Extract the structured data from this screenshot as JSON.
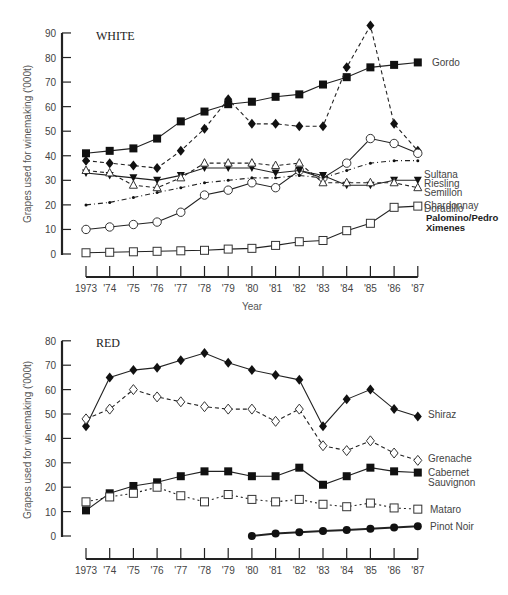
{
  "chart_data": [
    {
      "type": "line",
      "title": "WHITE",
      "xlabel": "Year",
      "ylabel": "Grapes used for winemaking ('000t)",
      "ylim": [
        0,
        90
      ],
      "yticks": [
        0,
        10,
        20,
        30,
        40,
        50,
        60,
        70,
        80,
        90
      ],
      "grid": false,
      "legend_position": "inline-right",
      "categories": [
        "1973",
        "'74",
        "'75",
        "'76",
        "'77",
        "'78",
        "'79",
        "'80",
        "'81",
        "'82",
        "'83",
        "'84",
        "'85",
        "'86",
        "'87"
      ],
      "series": [
        {
          "name": "Gordo",
          "marker": "filled-square",
          "line": "solid",
          "values": [
            41,
            42,
            43,
            47,
            54,
            58,
            61,
            62,
            64,
            65,
            69,
            72,
            76,
            77,
            78
          ]
        },
        {
          "name": "Sultana",
          "marker": "filled-diamond",
          "line": "dashed",
          "values": [
            38,
            37,
            36,
            35,
            42,
            51,
            63,
            53,
            53,
            52,
            52,
            76,
            93,
            53,
            42
          ]
        },
        {
          "name": "Riesling",
          "marker": "open-circle",
          "line": "solid",
          "values": [
            10,
            11,
            12,
            13,
            17,
            24,
            26,
            29,
            27,
            34,
            31,
            37,
            47,
            45,
            41
          ]
        },
        {
          "name": "Semillon",
          "marker": "small-dot",
          "line": "dash-dot",
          "values": [
            20,
            21,
            23,
            25,
            27,
            29,
            30,
            31,
            31,
            32,
            31,
            34,
            37,
            38,
            38
          ]
        },
        {
          "name": "Doradillo",
          "marker": "filled-triangle-down",
          "line": "solid",
          "values": [
            33,
            32,
            31,
            30,
            32,
            35,
            35,
            35,
            33,
            34,
            32,
            28,
            28,
            30,
            30
          ]
        },
        {
          "name": "Palomino/Pedro Ximenes",
          "marker": "open-triangle",
          "line": "dashed",
          "values": [
            34,
            33,
            28,
            27,
            31,
            37,
            37,
            37,
            36,
            37,
            29,
            29,
            29,
            29,
            27
          ]
        },
        {
          "name": "Chardonnay",
          "marker": "open-square",
          "line": "solid",
          "values": [
            0.5,
            0.7,
            0.9,
            1.1,
            1.3,
            1.5,
            2,
            2.3,
            3.5,
            5,
            5.5,
            9.5,
            12.5,
            19,
            19.5
          ]
        }
      ],
      "series_labels": {
        "gordo": "Gordo",
        "sultana": "Sultana",
        "riesling": "Riesling",
        "semillon": "Semillon",
        "doradillo": "Doradillo",
        "palomino_line1": "Palomino/Pedro",
        "palomino_line2": "Ximenes",
        "chardonnay": "Chardonnay"
      }
    },
    {
      "type": "line",
      "title": "RED",
      "xlabel": "",
      "ylabel": "Grapes used for winemaking ('000t)",
      "ylim": [
        0,
        80
      ],
      "yticks": [
        0,
        10,
        20,
        30,
        40,
        50,
        60,
        70,
        80
      ],
      "grid": false,
      "legend_position": "inline-right",
      "categories": [
        "1973",
        "'74",
        "'75",
        "'76",
        "'77",
        "'78",
        "'79",
        "'80",
        "'81",
        "'82",
        "'83",
        "'84",
        "'85",
        "'86",
        "'87"
      ],
      "series": [
        {
          "name": "Shiraz",
          "marker": "filled-diamond",
          "line": "solid",
          "values": [
            45,
            65,
            68,
            69,
            72,
            75,
            71,
            68,
            66,
            64,
            45,
            56,
            60,
            52,
            49
          ]
        },
        {
          "name": "Grenache",
          "marker": "open-diamond",
          "line": "dashed",
          "values": [
            48,
            52,
            60,
            57,
            55,
            53,
            52,
            52,
            47,
            52,
            37,
            35,
            39,
            34,
            31
          ]
        },
        {
          "name": "Cabernet Sauvignon",
          "marker": "filled-square",
          "line": "solid",
          "values": [
            10.5,
            17.5,
            20.5,
            22,
            24.5,
            26.5,
            26.5,
            24.5,
            24.5,
            28,
            21,
            24.5,
            28,
            26.5,
            26
          ]
        },
        {
          "name": "Mataro",
          "marker": "open-square",
          "line": "dotted",
          "values": [
            14,
            16,
            17.5,
            20,
            16.5,
            14,
            17,
            15,
            14,
            15,
            13,
            12,
            13.5,
            11.5,
            11
          ]
        },
        {
          "name": "Pinot Noir",
          "marker": "filled-circle",
          "line": "solid-thick",
          "values": [
            null,
            null,
            null,
            null,
            null,
            null,
            null,
            0,
            1,
            1.5,
            2,
            2.5,
            3,
            3.5,
            4
          ]
        }
      ],
      "series_labels": {
        "shiraz": "Shiraz",
        "grenache": "Grenache",
        "cabernet_line1": "Cabernet",
        "cabernet_line2": "Sauvignon",
        "mataro": "Mataro",
        "pinot": "Pinot Noir"
      }
    }
  ],
  "white": {
    "title": "WHITE",
    "ylabel": "Grapes used for winemaking ('000t)",
    "xlabel": "Year",
    "yticks": [
      "0",
      "10",
      "20",
      "30",
      "40",
      "50",
      "60",
      "70",
      "80",
      "90"
    ],
    "xticks": [
      "1973",
      "'74",
      "'75",
      "'76",
      "'77",
      "'78",
      "'79",
      "'80",
      "'81",
      "'82",
      "'83",
      "'84",
      "'85",
      "'86",
      "'87"
    ]
  },
  "red": {
    "title": "RED",
    "ylabel": "Grapes used for winemaking ('000t)",
    "yticks": [
      "0",
      "10",
      "20",
      "30",
      "40",
      "50",
      "60",
      "70",
      "80"
    ],
    "xticks": [
      "1973",
      "'74",
      "'75",
      "'76",
      "'77",
      "'78",
      "'79",
      "'80",
      "'81",
      "'82",
      "'83",
      "'84",
      "'85",
      "'86",
      "'87"
    ]
  }
}
